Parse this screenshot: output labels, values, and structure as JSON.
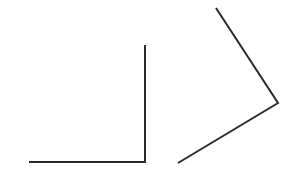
{
  "canvas": {
    "width": 293,
    "height": 177,
    "background_color": "#ffffff"
  },
  "chart_data": {
    "type": "diagram",
    "title": "",
    "subtitle": "",
    "xlabel": "",
    "ylabel": "",
    "grid": false,
    "legend": false,
    "axis_ranges": {
      "x": [
        0,
        293
      ],
      "y": [
        0,
        177
      ]
    },
    "stroke_color": "#2b2b2b",
    "stroke_width": 2,
    "figures": [
      {
        "name": "right-angle-figure",
        "label": "left angle",
        "angle_degrees": 90,
        "angle_type": "right",
        "opening_direction": "upper-left",
        "vertex": {
          "x": 145,
          "y": 162
        },
        "points": [
          {
            "x": 145,
            "y": 45
          },
          {
            "x": 145,
            "y": 162
          },
          {
            "x": 29,
            "y": 162
          }
        ],
        "rays": [
          {
            "name": "vertical-ray",
            "from": {
              "x": 145,
              "y": 162
            },
            "to": {
              "x": 145,
              "y": 45
            },
            "length": 117,
            "direction_degrees": 90
          },
          {
            "name": "horizontal-ray",
            "from": {
              "x": 145,
              "y": 162
            },
            "to": {
              "x": 29,
              "y": 162
            },
            "length": 116,
            "direction_degrees": 180
          }
        ]
      },
      {
        "name": "acute-angle-figure",
        "label": "right angle figure",
        "angle_degrees": 50,
        "angle_type": "acute",
        "opening_direction": "left",
        "vertex": {
          "x": 278,
          "y": 103
        },
        "points": [
          {
            "x": 216,
            "y": 8
          },
          {
            "x": 278,
            "y": 103
          },
          {
            "x": 178,
            "y": 163
          }
        ],
        "rays": [
          {
            "name": "upper-ray",
            "from": {
              "x": 278,
              "y": 103
            },
            "to": {
              "x": 216,
              "y": 8
            },
            "length": 113,
            "direction_degrees": 123
          },
          {
            "name": "lower-ray",
            "from": {
              "x": 278,
              "y": 103
            },
            "to": {
              "x": 178,
              "y": 163
            },
            "length": 117,
            "direction_degrees": 211
          }
        ]
      }
    ]
  }
}
